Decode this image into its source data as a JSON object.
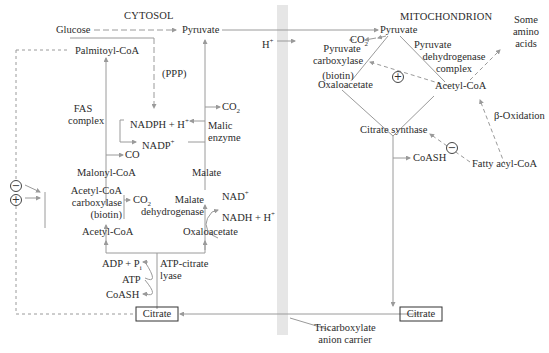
{
  "regions": {
    "cytosol": "CYTOSOL",
    "mitochondrion": "MITOCHONDRION"
  },
  "cytosol": {
    "glucose": "Glucose",
    "pyruvate": "Pyruvate",
    "palmitoyl_coa": "Palmitoyl-CoA",
    "ppp": "(PPP)",
    "fas_complex": [
      "FAS",
      "complex"
    ],
    "nadph": "NADPH + H",
    "nadph_sup": "+",
    "nadp": "NADP",
    "nadp_sup": "+",
    "co2_malic": "CO",
    "co2_malic_sub": "2",
    "malic_enzyme": [
      "Malic",
      "enzyme"
    ],
    "co_malonyl": "CO",
    "malonyl_coa": "Malonyl-CoA",
    "malate": "Malate",
    "acc_enzyme": [
      "Acetyl-CoA",
      "carboxylase",
      "(biotin)"
    ],
    "co2_acc": "CO",
    "co2_acc_sub": "2",
    "malate_dh": [
      "Malate",
      "dehydrogenase"
    ],
    "nad": "NAD",
    "nad_sup": "+",
    "nadh": "NADH + H",
    "nadh_sup": "+",
    "acetyl_coa": "Acetyl-CoA",
    "oxaloacetate": "Oxaloacetate",
    "adp_pi": "ADP + P",
    "adp_pi_sub": "i",
    "atp": "ATP",
    "coash": "CoASH",
    "atp_citrate_lyase": [
      "ATP-citrate",
      "lyase"
    ],
    "citrate": "Citrate",
    "inhibit_symbol": "−",
    "activate_symbol": "+"
  },
  "membrane": {
    "h_plus": "H",
    "h_plus_sup": "+",
    "carrier_label": [
      "Tricarboxylate",
      "anion carrier"
    ]
  },
  "mitochondrion": {
    "pyruvate": "Pyruvate",
    "co2": "CO",
    "co2_sub": "2",
    "pyruvate_carboxylase": [
      "Pyruvate",
      "carboxylase",
      "(biotin)"
    ],
    "oxaloacetate": "Oxaloacetate",
    "pdh_complex": [
      "Pyruvate",
      "dehydrogenase",
      "complex"
    ],
    "some_amino_acids": [
      "Some",
      "amino",
      "acids"
    ],
    "acetyl_coa": "Acetyl-CoA",
    "beta_oxidation": "β-Oxidation",
    "citrate_synthase": "Citrate synthase",
    "coash": "CoASH",
    "fatty_acyl_coa": "Fatty acyl-CoA",
    "citrate": "Citrate",
    "activate_symbol": "+",
    "inhibit_symbol": "−"
  },
  "colors": {
    "line": "#9a9a9a",
    "text": "#2b2b2b",
    "membrane": "#e6e6e6"
  }
}
